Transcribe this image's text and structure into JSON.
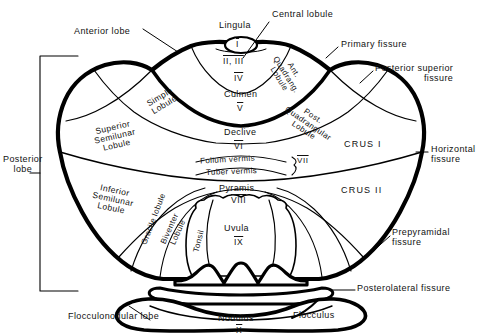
{
  "figure": {
    "ink_color": "#000000",
    "background": "#ffffff"
  },
  "labels": {
    "anterior_lobe": "Anterior  lobe",
    "posterior_lobe_line1": "Posterior",
    "posterior_lobe_line2": "lobe",
    "flocculonodular_lobe": "Flocculonodular  lobe",
    "lingula": "Lingula",
    "central_lobule": "Central  lobule",
    "primary_fissure": "Primary  fissure",
    "posterior_superior_fissure_line1": "Posterior  superior",
    "posterior_superior_fissure_line2": "fissure",
    "horizontal_fissure_line1": "Horizontal",
    "horizontal_fissure_line2": "fissure",
    "prepyramidal_fissure_line1": "Prepyramidal",
    "prepyramidal_fissure_line2": "fissure",
    "posterolateral_fissure": "Posterolateral  fissure",
    "simple_lobule_line1": "Simple",
    "simple_lobule_line2": "Lobule",
    "superior_semilunar_line1": "Superior",
    "superior_semilunar_line2": "Semilunar",
    "superior_semilunar_line3": "Lobule",
    "inferior_semilunar_line1": "Inferior",
    "inferior_semilunar_line2": "Semilunar",
    "inferior_semilunar_line3": "Lobule",
    "ant_quadrangular_line1": "Ant.",
    "ant_quadrangular_line2": "Quadrang.",
    "ant_quadrangular_line3": "Lobule",
    "post_quadrangular_line1": "Post.",
    "post_quadrangular_line2": "Quadrangular",
    "post_quadrangular_line3": "Lobule",
    "gracile_lobule": "Gracile lobule",
    "biventer_lobule_line1": "Biventer",
    "biventer_lobule_line2": "Lobule",
    "tonsil": "Tonsil",
    "crus_i": "CRUS I",
    "crus_ii": "CRUS II",
    "culmen": "Culmen",
    "declive": "Declive",
    "folium_vermis": "Folium    vermis",
    "tuber_vermis": "Tuber   vermis",
    "pyramis": "Pyramis",
    "uvula": "Uvula",
    "nodulus": "Nodulus",
    "flocculus": "Flocculus"
  },
  "roman_numerals": {
    "lingula": "I",
    "central_lobule": "II, III",
    "culmen_upper": "IV",
    "culmen_lower": "V",
    "declive": "VI",
    "folium_tuber": "VII",
    "pyramis": "VIII",
    "uvula": "IX",
    "nodulus": "X"
  }
}
